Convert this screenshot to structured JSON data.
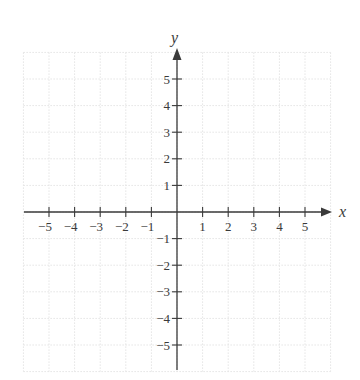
{
  "chart_data": {
    "type": "coordinate-plane",
    "title": "",
    "xlabel": "x",
    "ylabel": "y",
    "xlim": [
      -6,
      6
    ],
    "ylim": [
      -6,
      6
    ],
    "grid": true,
    "x_ticks": [
      -5,
      -4,
      -3,
      -2,
      -1,
      1,
      2,
      3,
      4,
      5
    ],
    "y_ticks": [
      -5,
      -4,
      -3,
      -2,
      -1,
      1,
      2,
      3,
      4,
      5
    ],
    "x_tick_labels": [
      "−5",
      "−4",
      "−3",
      "−2",
      "−1",
      "1",
      "2",
      "3",
      "4",
      "5"
    ],
    "y_tick_labels": [
      "−5",
      "−4",
      "−3",
      "−2",
      "−1",
      "1",
      "2",
      "3",
      "4",
      "5"
    ],
    "series": []
  },
  "colors": {
    "axis": "#3a3a3a",
    "grid": "#e4e4e4",
    "label": "#3a3a3a"
  }
}
